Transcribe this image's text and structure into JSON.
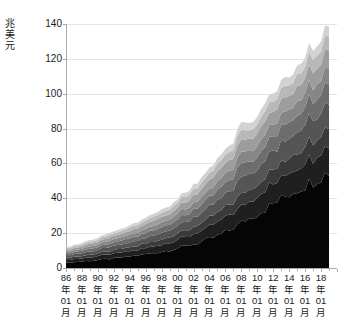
{
  "chart": {
    "type": "area",
    "title": "",
    "y_unit_label": "兆美元",
    "y_unit_chars": [
      "兆",
      "美",
      "元"
    ],
    "yticks": [
      0,
      20,
      40,
      60,
      80,
      100,
      120,
      140
    ],
    "ylim": [
      0,
      140
    ],
    "ylabel": "兆美元",
    "xlabel": "",
    "grid": "horizontal",
    "legend": "none",
    "axis_color": "#aaaaaa",
    "gridline_color": "#e4e4e4",
    "text_color": "#1a1a1a",
    "background": "#ffffff",
    "xtick_labels": [
      {
        "year": "86",
        "year_char": "年",
        "month": "01",
        "month_char": "月"
      },
      {
        "year": "88",
        "year_char": "年",
        "month": "01",
        "month_char": "月"
      },
      {
        "year": "90",
        "year_char": "年",
        "month": "01",
        "month_char": "月"
      },
      {
        "year": "92",
        "year_char": "年",
        "month": "01",
        "month_char": "月"
      },
      {
        "year": "94",
        "year_char": "年",
        "month": "01",
        "month_char": "月"
      },
      {
        "year": "96",
        "year_char": "年",
        "month": "01",
        "month_char": "月"
      },
      {
        "year": "98",
        "year_char": "年",
        "month": "01",
        "month_char": "月"
      },
      {
        "year": "00",
        "year_char": "年",
        "month": "01",
        "month_char": "月"
      },
      {
        "year": "02",
        "year_char": "年",
        "month": "01",
        "month_char": "月"
      },
      {
        "year": "04",
        "year_char": "年",
        "month": "01",
        "month_char": "月"
      },
      {
        "year": "06",
        "year_char": "年",
        "month": "01",
        "month_char": "月"
      },
      {
        "year": "08",
        "year_char": "年",
        "month": "01",
        "month_char": "月"
      },
      {
        "year": "10",
        "year_char": "年",
        "month": "01",
        "month_char": "月"
      },
      {
        "year": "12",
        "year_char": "年",
        "month": "01",
        "month_char": "月"
      },
      {
        "year": "14",
        "year_char": "年",
        "month": "01",
        "month_char": "月"
      },
      {
        "year": "16",
        "year_char": "年",
        "month": "01",
        "month_char": "月"
      },
      {
        "year": "18",
        "year_char": "年",
        "month": "01",
        "month_char": "月"
      }
    ]
  },
  "chart_data": {
    "type": "area",
    "stacked": true,
    "title": "",
    "xlabel": "",
    "ylabel": "兆美元",
    "ylim": [
      0,
      140
    ],
    "yticks": [
      0,
      20,
      40,
      60,
      80,
      100,
      120,
      140
    ],
    "grid": true,
    "legend_position": "none",
    "x_start_label": "86年01月",
    "x_end_label": "19年01月",
    "x": [
      1986.0,
      1986.5,
      1987.0,
      1987.5,
      1988.0,
      1988.5,
      1989.0,
      1989.5,
      1990.0,
      1990.5,
      1991.0,
      1991.5,
      1992.0,
      1992.5,
      1993.0,
      1993.5,
      1994.0,
      1994.5,
      1995.0,
      1995.5,
      1996.0,
      1996.5,
      1997.0,
      1997.5,
      1998.0,
      1998.5,
      1999.0,
      1999.5,
      2000.0,
      2000.5,
      2001.0,
      2001.5,
      2002.0,
      2002.5,
      2003.0,
      2003.5,
      2004.0,
      2004.5,
      2005.0,
      2005.5,
      2006.0,
      2006.5,
      2007.0,
      2007.5,
      2008.0,
      2008.5,
      2009.0,
      2009.5,
      2010.0,
      2010.5,
      2011.0,
      2011.5,
      2012.0,
      2012.5,
      2013.0,
      2013.5,
      2014.0,
      2014.5,
      2015.0,
      2015.5,
      2016.0,
      2016.5,
      2017.0,
      2017.5,
      2018.0,
      2018.5,
      2019.0
    ],
    "series": [
      {
        "name": "series-1",
        "color": "#050505",
        "values": [
          3.0,
          3.2,
          3.3,
          3.5,
          3.7,
          3.9,
          4.1,
          4.3,
          4.6,
          4.8,
          5.0,
          5.2,
          5.5,
          5.7,
          6.0,
          6.3,
          6.6,
          6.9,
          7.2,
          7.5,
          7.9,
          8.2,
          8.6,
          9.0,
          9.4,
          9.8,
          10.3,
          10.8,
          11.3,
          11.8,
          12.4,
          13.0,
          13.6,
          14.3,
          15.0,
          15.8,
          16.6,
          17.5,
          18.4,
          19.4,
          20.5,
          21.7,
          23.0,
          24.4,
          26.0,
          27.6,
          28.5,
          29.8,
          31.2,
          32.5,
          34.0,
          35.4,
          36.8,
          38.2,
          39.6,
          41.0,
          42.4,
          43.8,
          45.2,
          46.4,
          47.6,
          48.8,
          50.0,
          51.4,
          52.8,
          54.0,
          55.0
        ]
      },
      {
        "name": "series-2",
        "color": "#1f1f1f",
        "values": [
          1.6,
          1.7,
          1.7,
          1.8,
          1.9,
          2.0,
          2.0,
          2.1,
          2.2,
          2.3,
          2.4,
          2.5,
          2.6,
          2.7,
          2.8,
          2.9,
          3.0,
          3.1,
          3.2,
          3.4,
          3.5,
          3.6,
          3.8,
          4.0,
          4.1,
          4.3,
          4.5,
          4.7,
          4.9,
          5.1,
          5.3,
          5.6,
          5.8,
          6.1,
          6.4,
          6.6,
          6.9,
          7.2,
          7.6,
          7.9,
          8.3,
          8.7,
          9.1,
          9.5,
          9.9,
          10.2,
          9.8,
          10.0,
          10.3,
          10.6,
          10.9,
          11.2,
          11.5,
          11.8,
          12.1,
          12.4,
          12.7,
          13.0,
          13.3,
          13.6,
          13.9,
          14.2,
          14.5,
          14.8,
          15.1,
          15.4,
          15.7
        ]
      },
      {
        "name": "series-3",
        "color": "#3a3a3a",
        "values": [
          1.1,
          1.2,
          1.2,
          1.3,
          1.3,
          1.4,
          1.5,
          1.5,
          1.6,
          1.7,
          1.7,
          1.8,
          1.9,
          2.0,
          2.0,
          2.1,
          2.2,
          2.3,
          2.4,
          2.5,
          2.6,
          2.7,
          2.8,
          2.9,
          3.0,
          3.1,
          3.3,
          3.4,
          3.5,
          3.7,
          3.8,
          4.0,
          4.2,
          4.3,
          4.5,
          4.7,
          4.9,
          5.1,
          5.4,
          5.6,
          5.9,
          6.1,
          6.4,
          6.7,
          7.0,
          7.2,
          7.0,
          7.1,
          7.3,
          7.5,
          7.7,
          7.9,
          8.1,
          8.3,
          8.5,
          8.7,
          8.9,
          9.1,
          9.3,
          9.5,
          9.7,
          9.9,
          10.1,
          10.3,
          10.5,
          10.7,
          10.9
        ]
      },
      {
        "name": "series-4",
        "color": "#555555",
        "values": [
          1.4,
          1.5,
          1.5,
          1.6,
          1.7,
          1.8,
          1.8,
          1.9,
          2.0,
          2.1,
          2.2,
          2.3,
          2.4,
          2.5,
          2.6,
          2.7,
          2.8,
          2.9,
          3.0,
          3.2,
          3.3,
          3.4,
          3.6,
          3.7,
          3.9,
          4.0,
          4.2,
          4.4,
          4.6,
          4.8,
          5.0,
          5.2,
          5.4,
          5.6,
          5.9,
          6.1,
          6.4,
          6.7,
          7.0,
          7.3,
          7.6,
          8.0,
          8.3,
          8.7,
          9.1,
          9.3,
          9.0,
          9.2,
          9.4,
          9.6,
          9.9,
          10.1,
          10.4,
          10.6,
          10.9,
          11.1,
          11.4,
          11.6,
          11.9,
          12.1,
          12.4,
          12.6,
          12.9,
          13.1,
          13.4,
          13.6,
          13.9
        ]
      },
      {
        "name": "series-5",
        "color": "#6d6d6d",
        "values": [
          1.2,
          1.3,
          1.3,
          1.4,
          1.4,
          1.5,
          1.6,
          1.6,
          1.7,
          1.8,
          1.9,
          1.9,
          2.0,
          2.1,
          2.2,
          2.3,
          2.4,
          2.5,
          2.6,
          2.7,
          2.8,
          2.9,
          3.0,
          3.1,
          3.3,
          3.4,
          3.5,
          3.7,
          3.8,
          4.0,
          4.2,
          4.3,
          4.5,
          4.7,
          4.9,
          5.1,
          5.3,
          5.6,
          5.8,
          6.1,
          6.3,
          6.6,
          6.9,
          7.2,
          7.5,
          7.7,
          7.4,
          7.5,
          7.7,
          7.9,
          8.0,
          8.2,
          8.4,
          8.6,
          8.8,
          9.0,
          9.2,
          9.4,
          9.6,
          9.8,
          10.0,
          10.2,
          10.4,
          10.6,
          10.8,
          11.0,
          11.2
        ]
      },
      {
        "name": "series-6",
        "color": "#868686",
        "values": [
          1.0,
          1.0,
          1.1,
          1.1,
          1.2,
          1.2,
          1.3,
          1.3,
          1.4,
          1.5,
          1.5,
          1.6,
          1.7,
          1.7,
          1.8,
          1.9,
          2.0,
          2.0,
          2.1,
          2.2,
          2.3,
          2.4,
          2.5,
          2.6,
          2.7,
          2.8,
          2.9,
          3.0,
          3.2,
          3.3,
          3.4,
          3.6,
          3.7,
          3.9,
          4.0,
          4.2,
          4.4,
          4.6,
          4.8,
          5.0,
          5.2,
          5.4,
          5.7,
          5.9,
          6.2,
          6.3,
          6.1,
          6.2,
          6.3,
          6.5,
          6.6,
          6.8,
          6.9,
          7.1,
          7.2,
          7.4,
          7.5,
          7.7,
          7.8,
          8.0,
          8.1,
          8.3,
          8.4,
          8.6,
          8.8,
          8.9,
          9.1
        ]
      },
      {
        "name": "series-7",
        "color": "#9d9d9d",
        "values": [
          1.1,
          1.1,
          1.2,
          1.2,
          1.3,
          1.4,
          1.4,
          1.5,
          1.6,
          1.6,
          1.7,
          1.8,
          1.9,
          1.9,
          2.0,
          2.1,
          2.2,
          2.3,
          2.4,
          2.5,
          2.6,
          2.7,
          2.8,
          2.9,
          3.0,
          3.1,
          3.3,
          3.4,
          3.5,
          3.7,
          3.8,
          4.0,
          4.2,
          4.3,
          4.5,
          4.7,
          4.9,
          5.1,
          5.3,
          5.5,
          5.8,
          6.0,
          6.3,
          6.6,
          6.8,
          7.0,
          6.7,
          6.8,
          7.0,
          7.1,
          7.3,
          7.4,
          7.6,
          7.8,
          7.9,
          8.1,
          8.2,
          8.4,
          8.6,
          8.7,
          8.9,
          9.0,
          9.2,
          9.4,
          9.5,
          9.7,
          9.8
        ]
      },
      {
        "name": "series-8",
        "color": "#b8b8b8",
        "values": [
          0.9,
          0.9,
          1.0,
          1.0,
          1.1,
          1.1,
          1.2,
          1.2,
          1.3,
          1.3,
          1.4,
          1.5,
          1.5,
          1.6,
          1.7,
          1.7,
          1.8,
          1.9,
          2.0,
          2.0,
          2.1,
          2.2,
          2.3,
          2.4,
          2.5,
          2.6,
          2.7,
          2.8,
          2.9,
          3.0,
          3.1,
          3.2,
          3.4,
          3.5,
          3.6,
          3.8,
          3.9,
          4.1,
          4.3,
          4.4,
          4.6,
          4.8,
          5.0,
          5.2,
          5.4,
          5.5,
          5.3,
          5.4,
          5.5,
          5.6,
          5.7,
          5.9,
          6.0,
          6.1,
          6.2,
          6.4,
          6.5,
          6.6,
          6.7,
          6.9,
          7.0,
          7.1,
          7.2,
          7.4,
          7.5,
          7.6,
          7.8
        ]
      },
      {
        "name": "series-9",
        "color": "#d2d2d2",
        "values": [
          0.7,
          0.7,
          0.8,
          0.8,
          0.8,
          0.9,
          0.9,
          1.0,
          1.0,
          1.0,
          1.1,
          1.1,
          1.2,
          1.2,
          1.3,
          1.3,
          1.4,
          1.5,
          1.5,
          1.6,
          1.6,
          1.7,
          1.8,
          1.8,
          1.9,
          2.0,
          2.1,
          2.1,
          2.2,
          2.3,
          2.4,
          2.5,
          2.6,
          2.7,
          2.8,
          2.9,
          3.0,
          3.1,
          3.2,
          3.4,
          3.5,
          3.6,
          3.8,
          3.9,
          4.1,
          4.2,
          4.0,
          4.1,
          4.2,
          4.2,
          4.3,
          4.4,
          4.5,
          4.6,
          4.7,
          4.8,
          4.9,
          5.0,
          5.1,
          5.2,
          5.3,
          5.4,
          5.5,
          5.6,
          5.7,
          5.8,
          5.9
        ]
      }
    ],
    "total_start": 12.0,
    "total_end": 129.3,
    "peak_value": 130.0
  }
}
